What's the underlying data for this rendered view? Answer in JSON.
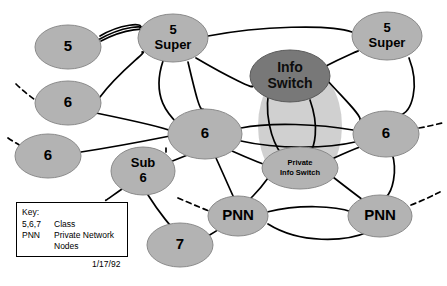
{
  "diagram": {
    "colors": {
      "node_fill": "#b3b3b3",
      "node_stroke": "#8a8a8a",
      "dark_node_fill": "#787878",
      "dark_node_stroke": "#5a5a5a",
      "cloud_fill": "#cccccc",
      "edge_color": "#000000",
      "background": "#ffffff",
      "key_border": "#000000"
    },
    "nodes": [
      {
        "id": "n5a",
        "label": "5",
        "lines": [
          "5"
        ],
        "cx": 68,
        "cy": 47,
        "rx": 33,
        "ry": 22,
        "style": "light"
      },
      {
        "id": "n5super_l",
        "label": "5 Super",
        "lines": [
          "5",
          "Super"
        ],
        "cx": 173,
        "cy": 38,
        "rx": 35,
        "ry": 24,
        "style": "light"
      },
      {
        "id": "n5super_r",
        "label": "5 Super",
        "lines": [
          "5",
          "Super"
        ],
        "cx": 387,
        "cy": 36,
        "rx": 35,
        "ry": 24,
        "style": "light"
      },
      {
        "id": "n6_upleft",
        "label": "6",
        "lines": [
          "6"
        ],
        "cx": 68,
        "cy": 103,
        "rx": 33,
        "ry": 22,
        "style": "light"
      },
      {
        "id": "n6_left",
        "label": "6",
        "lines": [
          "6"
        ],
        "cx": 48,
        "cy": 156,
        "rx": 33,
        "ry": 22,
        "style": "light"
      },
      {
        "id": "n6_center",
        "label": "6",
        "lines": [
          "6"
        ],
        "cx": 205,
        "cy": 134,
        "rx": 37,
        "ry": 25,
        "style": "light"
      },
      {
        "id": "n6_right",
        "label": "6",
        "lines": [
          "6"
        ],
        "cx": 386,
        "cy": 134,
        "rx": 33,
        "ry": 23,
        "style": "light"
      },
      {
        "id": "ninfo",
        "label": "Info Switch",
        "lines": [
          "Info",
          "Switch"
        ],
        "cx": 290,
        "cy": 76,
        "rx": 40,
        "ry": 26,
        "style": "dark"
      },
      {
        "id": "npriv",
        "label": "Private Info Switch",
        "lines": [
          "Private",
          "Info Switch"
        ],
        "cx": 300,
        "cy": 168,
        "rx": 38,
        "ry": 21,
        "style": "light"
      },
      {
        "id": "nsub6",
        "label": "Sub 6",
        "lines": [
          "Sub",
          "6"
        ],
        "cx": 143,
        "cy": 171,
        "rx": 32,
        "ry": 24,
        "style": "light"
      },
      {
        "id": "n7",
        "label": "7",
        "lines": [
          "7"
        ],
        "cx": 180,
        "cy": 245,
        "rx": 33,
        "ry": 22,
        "style": "light"
      },
      {
        "id": "npnn_l",
        "label": "PNN",
        "lines": [
          "PNN"
        ],
        "cx": 238,
        "cy": 216,
        "rx": 30,
        "ry": 20,
        "style": "light"
      },
      {
        "id": "npnn_r",
        "label": "PNN",
        "lines": [
          "PNN"
        ],
        "cx": 380,
        "cy": 216,
        "rx": 32,
        "ry": 21,
        "style": "light"
      }
    ],
    "cloud": {
      "name": "info-switch-cloud",
      "cx": 300,
      "cy": 126,
      "rx": 42,
      "ry": 62
    },
    "edges_solid": [
      "M 100,36 C 120,24 145,22 140,28",
      "M 98,40 C 122,26 148,24 142,30",
      "M 101,41 C 126,28 150,27 141,33",
      "M 208,36 C 260,26 330,24 352,32",
      "M 196,58 C 230,78 256,90 252,86",
      "M 188,62 C 196,96 200,112 203,109",
      "M 163,61 C 150,100 172,118 180,126",
      "M 96,113 C 130,120 165,128 171,131",
      "M 81,152 C 120,146 160,138 170,136",
      "M 100,97 C 120,70 150,50 142,52",
      "M 327,80 C 345,100 362,116 360,120",
      "M 322,68 C 345,56 365,48 356,52",
      "M 409,58 C 420,86 412,112 400,115",
      "M 241,128 C 270,122 320,124 353,130",
      "M 241,141 C 280,150 330,148 355,142",
      "M 232,151 C 252,160 268,166 266,165",
      "M 271,82 C 262,112 272,142 282,155",
      "M 310,100 C 320,128 314,148 310,151",
      "M 216,158 C 226,180 232,194 234,198",
      "M 190,154 C 175,160 165,164 170,162",
      "M 268,178 C 258,192 246,204 244,202",
      "M 333,177 C 352,192 366,202 364,201",
      "M 334,158 C 356,148 372,142 366,146",
      "M 267,212 C 300,204 335,206 352,212",
      "M 268,224 C 300,244 345,242 368,232",
      "M 392,153 C 398,172 392,192 386,197",
      "M 148,195 C 160,214 172,228 175,230",
      "M 122,189 C 112,196 104,202 106,200",
      "M 208,236 C 218,230 224,226 222,227",
      "M 166,148 C 166,152 166,152 166,152"
    ],
    "edges_dashed": [
      "M 16,84 C 28,96 44,106 50,110",
      "M 8,138 C 20,146 32,152 38,155",
      "M 178,198 C 192,204 206,210 212,212",
      "M 411,205 C 424,200 436,194 440,192",
      "M 419,128 C 430,126 438,124 442,123"
    ],
    "key": {
      "title": "Key:",
      "rows": [
        {
          "term": "5,6,7",
          "definition": "Class"
        },
        {
          "term": "PNN",
          "definition": "Private Network"
        }
      ],
      "continuation": "Nodes",
      "date": "1/17/92"
    }
  }
}
